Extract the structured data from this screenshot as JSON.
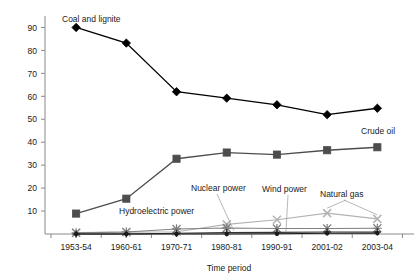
{
  "chart_data": {
    "type": "line",
    "title": "",
    "xlabel": "Time period",
    "ylabel": "",
    "categories": [
      "1953-54",
      "1960-61",
      "1970-71",
      "1980-81",
      "1990-91",
      "2001-02",
      "2003-04"
    ],
    "ylim": [
      0,
      95
    ],
    "yticks": [
      10,
      20,
      30,
      40,
      50,
      60,
      70,
      80,
      90
    ],
    "grid": false,
    "legend_position": "inline-annotations",
    "series": [
      {
        "name": "Coal and lignite",
        "values": [
          90,
          83.2,
          62,
          59.2,
          56.3,
          52,
          54.8
        ],
        "color": "#000000",
        "marker": "diamond"
      },
      {
        "name": "Crude oil",
        "values": [
          8.9,
          15.4,
          32.8,
          35.5,
          34.6,
          36.5,
          37.8
        ],
        "color": "#4d4d4d",
        "marker": "square"
      },
      {
        "name": "Natural gas",
        "values": [
          0.6,
          0.8,
          1.0,
          4.2,
          6.2,
          9.1,
          6.6
        ],
        "color": "#b3b3b3",
        "marker": "cross"
      },
      {
        "name": "Hydroelectric power",
        "values": [
          0.5,
          0.9,
          2.2,
          2.6,
          2.4,
          2.4,
          2.5
        ],
        "color": "#808080",
        "marker": "star"
      },
      {
        "name": "Nuclear power",
        "values": [
          0.0,
          0.0,
          0.3,
          0.6,
          0.7,
          0.9,
          0.9
        ],
        "color": "#333333",
        "marker": "plus"
      },
      {
        "name": "Wind power",
        "values": [
          0.0,
          0.0,
          0.0,
          0.0,
          0.1,
          0.3,
          0.4
        ],
        "color": "#1a1a1a",
        "marker": "dot"
      }
    ],
    "annotations": [
      {
        "id": "coal-and-lignite",
        "text": "Coal and lignite",
        "x": 62,
        "y": 22
      },
      {
        "id": "crude-oil",
        "text": "Crude oil",
        "x": 361,
        "y": 134
      },
      {
        "id": "hydroelectric-power",
        "text": "Hydroelectric power",
        "x": 119,
        "y": 214
      },
      {
        "id": "nuclear-power",
        "text": "Nuclear power",
        "x": 191,
        "y": 191
      },
      {
        "id": "wind-power",
        "text": "Wind power",
        "x": 262,
        "y": 192
      },
      {
        "id": "natural-gas",
        "text": "Natural gas",
        "x": 320,
        "y": 197
      }
    ]
  },
  "axis": {
    "x_title": "Time period",
    "x_labels": [
      "1953-54",
      "1960-61",
      "1970-71",
      "1980-81",
      "1990-91",
      "2001-02",
      "2003-04"
    ],
    "y_labels": [
      "90",
      "80",
      "70",
      "60",
      "50",
      "40",
      "30",
      "20",
      "10"
    ]
  }
}
